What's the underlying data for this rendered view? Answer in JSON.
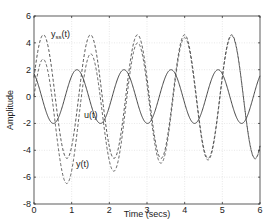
{
  "chart_data": {
    "type": "line",
    "title": "",
    "xlabel": "Time (secs)",
    "ylabel": "Amplitude",
    "xlim": [
      0,
      6
    ],
    "ylim": [
      -8,
      6
    ],
    "xticks": [
      0,
      1,
      2,
      3,
      4,
      5,
      6
    ],
    "yticks": [
      -8,
      -6,
      -4,
      -2,
      0,
      2,
      4,
      6
    ],
    "xtick_labels": [
      "0",
      "1",
      "2",
      "3",
      "4",
      "5",
      "6"
    ],
    "ytick_labels": [
      "-8",
      "-6",
      "-4",
      "-2",
      "0",
      "2",
      "4",
      "6"
    ],
    "grid": true,
    "legend": "inline annotations",
    "x": [
      0,
      0.1,
      0.2,
      0.3,
      0.4,
      0.5,
      0.6,
      0.7,
      0.8,
      0.9,
      1.0,
      1.1,
      1.2,
      1.3,
      1.4,
      1.5,
      1.6,
      1.7,
      1.8,
      1.9,
      2.0,
      2.1,
      2.2,
      2.3,
      2.4,
      2.5,
      2.6,
      2.7,
      2.8,
      2.9,
      3.0,
      3.1,
      3.2,
      3.3,
      3.4,
      3.5,
      3.6,
      3.7,
      3.8,
      3.9,
      4.0,
      4.1,
      4.2,
      4.3,
      4.4,
      4.5,
      4.6,
      4.7,
      4.8,
      4.9,
      5.0,
      5.1,
      5.2,
      5.3,
      5.4,
      5.5,
      5.6,
      5.7,
      5.8,
      5.9,
      6.0
    ],
    "series": [
      {
        "name": "u(t)",
        "style": "solid",
        "model": {
          "amplitude": 2.0,
          "omega": 5.03,
          "peak_time": 1.14
        },
        "peak_values": {
          "max": 2.0,
          "min": -2.0
        }
      },
      {
        "name": "y_ss(t)",
        "style": "dashed",
        "model": {
          "amplitude": 4.6,
          "omega": 5.03,
          "peak_time": 0.25
        },
        "peak_values": {
          "max": 4.6,
          "min": -4.6
        }
      },
      {
        "name": "y(t)",
        "style": "dashed",
        "model": {
          "amplitude": 4.6,
          "omega": 5.03,
          "peak_time": 0.25,
          "transient_a": 1.4,
          "transient_b": 4.0,
          "transient_decay": 1.1
        },
        "peak_values": {
          "first_min": -6.6,
          "second_min": -5.3
        }
      }
    ],
    "annotations": [
      {
        "text": "y",
        "sub": "ss",
        "suffix": "(t)",
        "x": 0.45,
        "y": 4.4
      },
      {
        "text": "u(t)",
        "x": 1.35,
        "y": -1.4
      },
      {
        "text": "y(t)",
        "x": 1.15,
        "y": -5.0
      }
    ]
  },
  "labels": {
    "xlabel": "Time (secs)",
    "ylabel": "Amplitude",
    "yss_main": "y",
    "yss_sub": "ss",
    "yss_suffix": "(t)",
    "u": "u(t)",
    "y": "y(t)"
  }
}
